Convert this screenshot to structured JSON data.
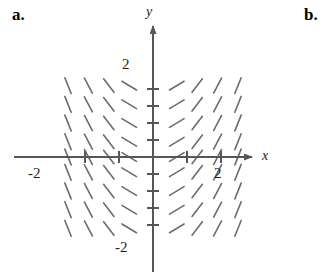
{
  "figure": {
    "part_labels": [
      {
        "id": "a",
        "text": "a."
      },
      {
        "id": "b",
        "text": "b."
      }
    ]
  },
  "axes": {
    "x_label": "x",
    "y_label": "y",
    "origin_px": {
      "x": 153,
      "y": 157
    },
    "unit_px": 34,
    "x_axis_y_px": 157,
    "y_axis_x_px": 153,
    "stroke_color": "#55565a",
    "stroke_width": 2,
    "tick_half_len": 6,
    "x_ticks": [
      -2,
      -1,
      1,
      2
    ],
    "y_ticks": [
      -2,
      -1.5,
      -1,
      -0.5,
      0.5,
      1,
      1.5,
      2
    ],
    "tick_labels": [
      {
        "id": "y-pos2",
        "text": "2",
        "axis": "y",
        "value": 2
      },
      {
        "id": "y-neg2",
        "text": "-2",
        "axis": "y",
        "value": -2
      },
      {
        "id": "x-neg2",
        "text": "-2",
        "axis": "x",
        "value": -2
      },
      {
        "id": "x-pos2",
        "text": "2",
        "axis": "x",
        "value": 2
      }
    ]
  },
  "chart_data": {
    "type": "scatter",
    "title": "",
    "subtitle": "",
    "xlabel": "x",
    "ylabel": "y",
    "xlim": [
      -3,
      3
    ],
    "ylim": [
      -3,
      3
    ],
    "grid": false,
    "legend": null,
    "segment_style": {
      "color": "#6b6c70",
      "width": 1.6,
      "length_px": 17
    },
    "slope_rule": "slope = x",
    "x_samples": [
      -2.5,
      -1.9,
      -1.3,
      -0.7,
      0.7,
      1.3,
      1.9,
      2.5
    ],
    "y_samples": [
      2.1,
      1.55,
      1.0,
      0.45,
      0.0,
      -0.45,
      -1.0,
      -1.55,
      -2.1
    ],
    "column_slopes": [
      -2.5,
      -1.9,
      -1.3,
      -0.6,
      0.6,
      1.3,
      1.9,
      2.5
    ]
  }
}
